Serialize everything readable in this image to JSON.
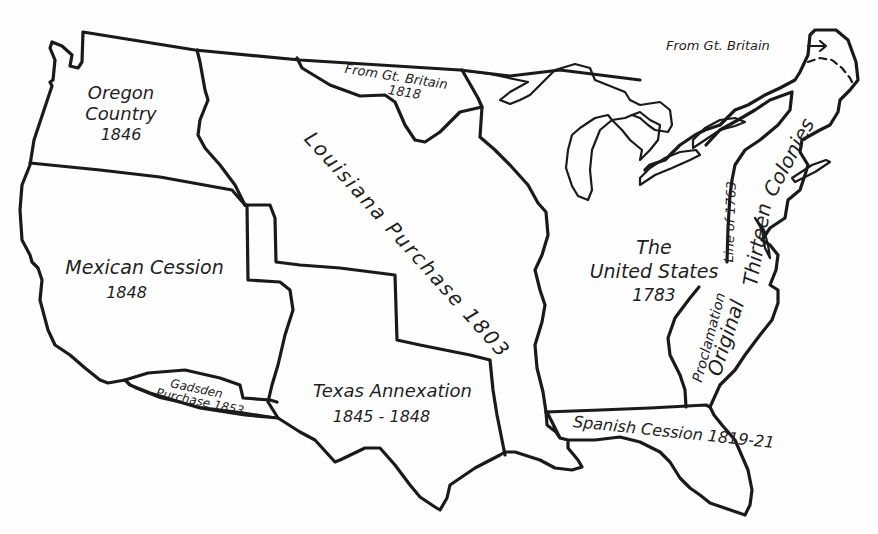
{
  "map": {
    "title": "Territorial Growth of the United States",
    "stroke_color": "#1a1a1a",
    "background": "#fefefe",
    "regions": [
      {
        "id": "oregon",
        "name": "Oregon Country",
        "year": "1846"
      },
      {
        "id": "from-gb-1818",
        "name": "From Gt. Britain",
        "year": "1818"
      },
      {
        "id": "louisiana",
        "name": "Louisiana Purchase",
        "year": "1803"
      },
      {
        "id": "mexican",
        "name": "Mexican Cession",
        "year": "1848"
      },
      {
        "id": "gadsden",
        "name": "Gadsden",
        "name2": "Purchase",
        "year": "1853"
      },
      {
        "id": "texas",
        "name": "Texas Annexation",
        "year": "1845 - 1848"
      },
      {
        "id": "us1783",
        "name": "The",
        "name2": "United States",
        "year": "1783"
      },
      {
        "id": "colonies",
        "name": "Original Thirteen Colonies"
      },
      {
        "id": "spanish",
        "name": "Spanish Cession",
        "year": "1819-21"
      }
    ],
    "annotations": {
      "maine": "From Gt. Britain",
      "proclamation_line": "Proclamation Line of 1763"
    }
  },
  "labels": {
    "oregon_1": "Oregon",
    "oregon_2": "Country",
    "oregon_3": "1846",
    "gb1818_1": "From Gt. Britain",
    "gb1818_2": "1818",
    "louisiana": "Louisiana Purchase 1803",
    "mexican_1": "Mexican Cession",
    "mexican_2": "1848",
    "gadsden_1": "Gadsden",
    "gadsden_2": "Purchase 1853",
    "texas_1": "Texas Annexation",
    "texas_2": "1845 - 1848",
    "us_1": "The",
    "us_2": "United States",
    "us_3": "1783",
    "proclamation": "Proclamation",
    "line1763": "Line of 1763",
    "original": "Original",
    "thirteen": "Thirteen",
    "colonies": "Colonies",
    "spanish": "Spanish Cession 1819-21",
    "maine": "From Gt. Britain"
  }
}
